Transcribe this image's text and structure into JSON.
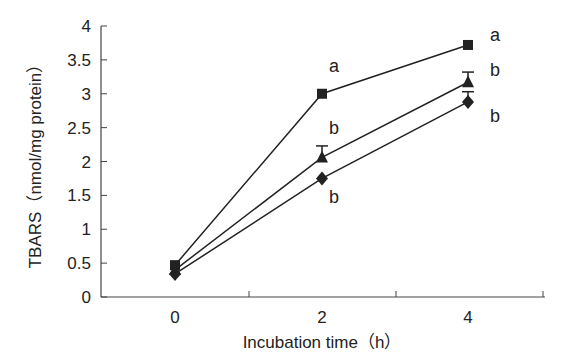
{
  "chart_data": {
    "type": "line",
    "title": "",
    "xlabel": "Incubation time（h）",
    "ylabel": "TBARS（nmol/mg protein）",
    "categories": [
      "0",
      "2",
      "4"
    ],
    "x": [
      0,
      2,
      4
    ],
    "ylim": [
      0,
      4
    ],
    "yticks": [
      "0",
      "0.5",
      "1",
      "1.5",
      "2",
      "2.5",
      "3",
      "3.5",
      "4"
    ],
    "grid": false,
    "legend": "none",
    "series": [
      {
        "name": "square",
        "marker": "square",
        "values": [
          0.47,
          3.0,
          3.72
        ],
        "error_upper": [
          0.0,
          0.0,
          0.0
        ],
        "significance": [
          "",
          "a",
          "a"
        ]
      },
      {
        "name": "triangle",
        "marker": "triangle",
        "values": [
          0.4,
          2.06,
          3.17
        ],
        "error_upper": [
          0.0,
          0.17,
          0.15
        ],
        "significance": [
          "",
          "b",
          "b"
        ]
      },
      {
        "name": "diamond",
        "marker": "diamond",
        "values": [
          0.34,
          1.75,
          2.88
        ],
        "error_upper": [
          0.0,
          0.0,
          0.15
        ],
        "significance": [
          "",
          "b",
          "b"
        ]
      }
    ],
    "annotations": [
      "a",
      "b",
      "b",
      "a",
      "b",
      "b"
    ]
  },
  "colors": {
    "line": "#222222",
    "axis": "#444444",
    "text": "#222222"
  }
}
